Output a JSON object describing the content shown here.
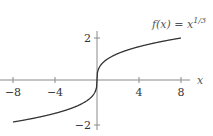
{
  "chart_data": {
    "type": "line",
    "title": "",
    "function_label": "f(x) = x^{1/3}",
    "function_label_parts": {
      "lhs": "f(x) = x",
      "exponent": "1/3"
    },
    "xlabel": "x",
    "ylabel": "",
    "xlim": [
      -9.2,
      8.8
    ],
    "ylim": [
      -2.3,
      2.6
    ],
    "x_ticks": [
      -8,
      -4,
      4,
      8
    ],
    "x_tick_labels": [
      "−8",
      "−4",
      "4",
      "8"
    ],
    "y_ticks": [
      2,
      -2
    ],
    "y_tick_labels": [
      "2",
      "−2"
    ],
    "grid": false,
    "legend": null,
    "series": [
      {
        "name": "f(x) = x^(1/3)",
        "x": [
          -8,
          -6,
          -4,
          -2,
          -1,
          -0.5,
          -0.1,
          0,
          0.1,
          0.5,
          1,
          2,
          4,
          6,
          8
        ],
        "y": [
          -2,
          -1.817,
          -1.587,
          -1.26,
          -1,
          -0.794,
          -0.464,
          0,
          0.464,
          0.794,
          1,
          1.26,
          1.587,
          1.817,
          2
        ]
      }
    ],
    "colors": {
      "curve": "#333333",
      "axis": "#888888"
    }
  }
}
